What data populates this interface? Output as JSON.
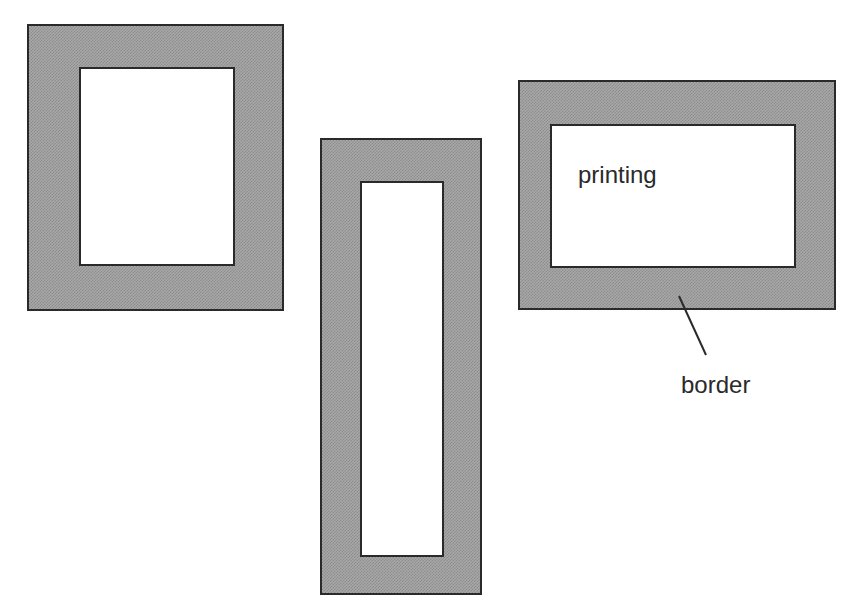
{
  "diagram": {
    "type": "frame-border-illustration",
    "frames": [
      {
        "id": "portrait",
        "outer": [
          27,
          24,
          257,
          287
        ],
        "inner": [
          79,
          67,
          156,
          199
        ]
      },
      {
        "id": "tall-narrow",
        "outer": [
          320,
          138,
          162,
          457
        ],
        "inner": [
          360,
          181,
          84,
          376
        ]
      },
      {
        "id": "landscape",
        "outer": [
          518,
          80,
          318,
          230
        ],
        "inner": [
          550,
          124,
          246,
          144
        ]
      }
    ],
    "labels": {
      "printing": "printing",
      "border": "border"
    },
    "colors": {
      "border_fill": "#a8a8a8",
      "outline": "#2a2a2a",
      "background": "#ffffff"
    }
  }
}
